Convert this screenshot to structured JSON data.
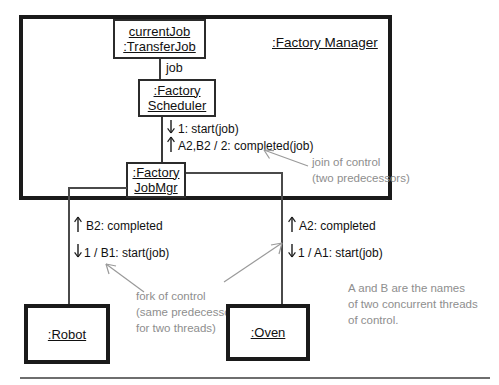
{
  "diagram": {
    "container": {
      "title": ":Factory Manager"
    },
    "objects": [
      {
        "id": "currentjob",
        "lines": [
          "currentJob",
          ":TransferJob"
        ]
      },
      {
        "id": "scheduler",
        "lines": [
          ":Factory",
          "Scheduler"
        ]
      },
      {
        "id": "jobmgr",
        "lines": [
          ":Factory",
          "JobMgr"
        ]
      },
      {
        "id": "robot",
        "lines": [
          ":Robot"
        ]
      },
      {
        "id": "oven",
        "lines": [
          ":Oven"
        ]
      }
    ],
    "role_labels": [
      {
        "id": "job-role",
        "text": "job"
      }
    ],
    "messages": [
      {
        "id": "msg-start-job",
        "arrow": "down",
        "text": "1: start(job)"
      },
      {
        "id": "msg-completed-job",
        "arrow": "up",
        "text": "A2,B2 / 2: completed(job)"
      },
      {
        "id": "msg-b2-completed",
        "arrow": "up",
        "text": "B2: completed"
      },
      {
        "id": "msg-b1-start",
        "arrow": "down",
        "text": "1 / B1: start(job)"
      },
      {
        "id": "msg-a2-completed",
        "arrow": "up",
        "text": "A2: completed"
      },
      {
        "id": "msg-a1-start",
        "arrow": "down",
        "text": "1 / A1: start(job)"
      }
    ],
    "notes": [
      {
        "id": "note-join",
        "lines": [
          "join of control",
          "(two predecessors)"
        ]
      },
      {
        "id": "note-fork",
        "lines": [
          "fork of control",
          "(same predecessor",
          "for two threads)"
        ]
      },
      {
        "id": "note-threads",
        "lines": [
          "A and B are the names",
          "of two concurrent threads",
          "of control."
        ]
      }
    ],
    "colors": {
      "ink": "#111111",
      "outer_border": "#1a1a1a",
      "inner_border": "#2b2b2b",
      "line": "#3a3a3a",
      "note_gray": "#8e8e8e",
      "rule_gray": "#6e6e6e",
      "background": "#ffffff"
    }
  }
}
